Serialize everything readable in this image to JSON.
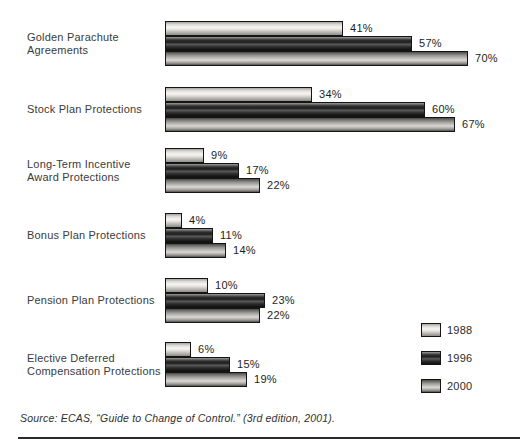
{
  "chart_data": {
    "type": "bar",
    "orientation": "horizontal",
    "bar_style": "3d-cylinder",
    "categories": [
      "Golden Parachute Agreements",
      "Stock Plan Protections",
      "Long-Term Incentive Award Protections",
      "Bonus Plan Protections",
      "Pension Plan Protections",
      "Elective Deferred Compensation Protections"
    ],
    "category_lines": [
      [
        "Golden Parachute",
        "Agreements"
      ],
      [
        "Stock Plan Protections"
      ],
      [
        "Long-Term Incentive",
        "Award Protections"
      ],
      [
        "Bonus Plan Protections"
      ],
      [
        "Pension Plan Protections"
      ],
      [
        "Elective Deferred",
        "Compensation Protections"
      ]
    ],
    "series": [
      {
        "name": "1988",
        "values": [
          41,
          34,
          9,
          4,
          10,
          6
        ]
      },
      {
        "name": "1996",
        "values": [
          57,
          60,
          17,
          11,
          23,
          15
        ]
      },
      {
        "name": "2000",
        "values": [
          70,
          67,
          22,
          14,
          22,
          19
        ]
      }
    ],
    "value_suffix": "%",
    "xlim": [
      0,
      100
    ],
    "grid": false,
    "legend_position": "bottom-right"
  },
  "legend": {
    "items": [
      {
        "label": "1988"
      },
      {
        "label": "1996"
      },
      {
        "label": "2000"
      }
    ]
  },
  "colors": {
    "bar_1988_light": "#f6f5f2",
    "bar_1988_dark": "#8e8d89",
    "bar_1996_light": "#5a5a5a",
    "bar_1996_dark": "#101010",
    "bar_2000_light": "#d9d8d4",
    "bar_2000_dark": "#52514e",
    "bar_border": "#141414",
    "text": "#3b3b3b",
    "rule": "#2b2b2b",
    "background": "#ffffff"
  },
  "footer": {
    "source": "Source: ECAS, “Guide to Change of Control.” (3rd edition, 2001)."
  }
}
